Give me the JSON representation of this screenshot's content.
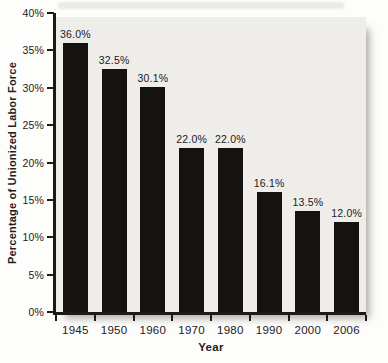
{
  "chart_data": {
    "type": "bar",
    "title": "",
    "xlabel": "Year",
    "ylabel": "Percentage of Unionized Labor Force",
    "categories": [
      "1945",
      "1950",
      "1960",
      "1970",
      "1980",
      "1990",
      "2000",
      "2006"
    ],
    "values": [
      36.0,
      32.5,
      30.1,
      22.0,
      22.0,
      16.1,
      13.5,
      12.0
    ],
    "value_labels": [
      "36.0%",
      "32.5%",
      "30.1%",
      "22.0%",
      "22.0%",
      "16.1%",
      "13.5%",
      "12.0%"
    ],
    "ylim": [
      0,
      40
    ],
    "ytick_step": 5,
    "ytick_labels": [
      "0%",
      "5%",
      "10%",
      "15%",
      "20%",
      "25%",
      "30%",
      "35%",
      "40%"
    ],
    "grid": false,
    "legend": false,
    "colors": {
      "bar": "#151311",
      "panel": "#eeedea",
      "axis": "#1c1a17",
      "text": "#21201e",
      "background": "#fdfdfc"
    }
  }
}
